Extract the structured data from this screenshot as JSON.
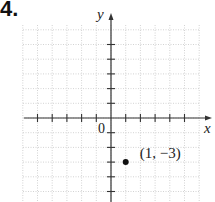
{
  "problem": {
    "number": "4."
  },
  "chart_data": {
    "type": "scatter",
    "title": "",
    "xlabel": "x",
    "ylabel": "y",
    "origin_label": "0",
    "xlim": [
      -6,
      6
    ],
    "ylim": [
      -6,
      6
    ],
    "grid": true,
    "x_ticks": [
      -5,
      -4,
      -3,
      -2,
      -1,
      1,
      2,
      3,
      4,
      5
    ],
    "y_ticks": [
      -5,
      -4,
      -3,
      -2,
      -1,
      1,
      2,
      3,
      4,
      5
    ],
    "points": [
      {
        "x": 1,
        "y": -3,
        "label": "(1, −3)"
      }
    ]
  }
}
